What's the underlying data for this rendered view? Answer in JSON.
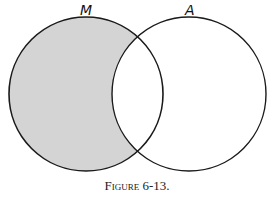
{
  "figure": {
    "caption": "Figure 6-13.",
    "sets": [
      {
        "label": "M",
        "cx": 86,
        "cy": 94,
        "r": 77,
        "shaded": "difference"
      },
      {
        "label": "A",
        "cx": 189,
        "cy": 94,
        "r": 77,
        "shaded": "none"
      }
    ],
    "shaded_region": "M minus A",
    "colors": {
      "shade": "#d4d4d4",
      "stroke": "#1a1a1a",
      "background": "#ffffff"
    }
  }
}
